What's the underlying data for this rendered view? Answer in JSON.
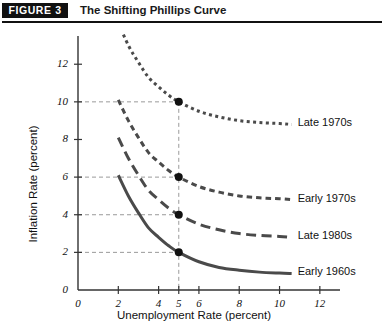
{
  "header": {
    "badge": "FIGURE 3",
    "title": "The Shifting Phillips Curve"
  },
  "chart_data": {
    "type": "line",
    "title": "The Shifting Phillips Curve",
    "xlabel": "Unemployment Rate (percent)",
    "ylabel": "Inflation Rate (percent)",
    "xlim": [
      0,
      13
    ],
    "ylim": [
      0,
      13.5
    ],
    "xticks": [
      0,
      2,
      4,
      5,
      6,
      8,
      10,
      12
    ],
    "xtick_labels": [
      "0",
      "2",
      "4",
      "5",
      "6",
      "8",
      "10",
      "12"
    ],
    "yticks": [
      0,
      2,
      4,
      6,
      8,
      10,
      12
    ],
    "ytick_labels": [
      "0",
      "2",
      "4",
      "6",
      "8",
      "10",
      "12"
    ],
    "grid": false,
    "legend_position": "right-inline",
    "series": [
      {
        "name": "Late 1970s",
        "label": "Late 1970s",
        "style": "dotted",
        "color": "#4a4a4a",
        "marker_point": {
          "x": 5,
          "y": 10
        },
        "points": [
          {
            "x": 2.0,
            "y": 14.2
          },
          {
            "x": 2.5,
            "y": 13.0
          },
          {
            "x": 3.0,
            "y": 12.1
          },
          {
            "x": 3.5,
            "y": 11.3
          },
          {
            "x": 4.0,
            "y": 10.8
          },
          {
            "x": 4.5,
            "y": 10.35
          },
          {
            "x": 5.0,
            "y": 10.0
          },
          {
            "x": 6.0,
            "y": 9.5
          },
          {
            "x": 7.0,
            "y": 9.2
          },
          {
            "x": 8.0,
            "y": 9.0
          },
          {
            "x": 9.0,
            "y": 8.9
          },
          {
            "x": 10.0,
            "y": 8.85
          },
          {
            "x": 10.6,
            "y": 8.8
          }
        ]
      },
      {
        "name": "Early 1970s",
        "label": "Early 1970s",
        "style": "dashed-short",
        "color": "#4a4a4a",
        "marker_point": {
          "x": 5,
          "y": 6
        },
        "points": [
          {
            "x": 2.0,
            "y": 10.1
          },
          {
            "x": 2.5,
            "y": 9.0
          },
          {
            "x": 3.0,
            "y": 8.1
          },
          {
            "x": 3.5,
            "y": 7.3
          },
          {
            "x": 4.0,
            "y": 6.8
          },
          {
            "x": 4.5,
            "y": 6.35
          },
          {
            "x": 5.0,
            "y": 6.0
          },
          {
            "x": 6.0,
            "y": 5.5
          },
          {
            "x": 7.0,
            "y": 5.2
          },
          {
            "x": 8.0,
            "y": 5.0
          },
          {
            "x": 9.0,
            "y": 4.9
          },
          {
            "x": 10.0,
            "y": 4.85
          },
          {
            "x": 10.6,
            "y": 4.8
          }
        ]
      },
      {
        "name": "Late 1980s",
        "label": "Late 1980s",
        "style": "dashed-long",
        "color": "#4a4a4a",
        "marker_point": {
          "x": 5,
          "y": 4
        },
        "points": [
          {
            "x": 2.0,
            "y": 8.1
          },
          {
            "x": 2.5,
            "y": 7.0
          },
          {
            "x": 3.0,
            "y": 6.1
          },
          {
            "x": 3.5,
            "y": 5.3
          },
          {
            "x": 4.0,
            "y": 4.8
          },
          {
            "x": 4.5,
            "y": 4.35
          },
          {
            "x": 5.0,
            "y": 4.0
          },
          {
            "x": 6.0,
            "y": 3.5
          },
          {
            "x": 7.0,
            "y": 3.2
          },
          {
            "x": 8.0,
            "y": 3.0
          },
          {
            "x": 9.0,
            "y": 2.9
          },
          {
            "x": 10.0,
            "y": 2.85
          },
          {
            "x": 10.6,
            "y": 2.8
          }
        ]
      },
      {
        "name": "Early 1960s",
        "label": "Early 1960s",
        "style": "solid",
        "color": "#4a4a4a",
        "marker_point": {
          "x": 5,
          "y": 2
        },
        "points": [
          {
            "x": 2.0,
            "y": 6.1
          },
          {
            "x": 2.5,
            "y": 5.0
          },
          {
            "x": 3.0,
            "y": 4.1
          },
          {
            "x": 3.5,
            "y": 3.3
          },
          {
            "x": 4.0,
            "y": 2.8
          },
          {
            "x": 4.5,
            "y": 2.35
          },
          {
            "x": 5.0,
            "y": 2.0
          },
          {
            "x": 6.0,
            "y": 1.5
          },
          {
            "x": 7.0,
            "y": 1.2
          },
          {
            "x": 8.0,
            "y": 1.05
          },
          {
            "x": 9.0,
            "y": 0.95
          },
          {
            "x": 10.0,
            "y": 0.9
          },
          {
            "x": 10.6,
            "y": 0.88
          }
        ]
      }
    ],
    "guide_lines": {
      "vertical_at_x": 5,
      "horizontal_at_y": [
        10,
        6,
        4,
        2
      ],
      "color": "#9a9a9a"
    },
    "colors": {
      "axis": "#333333",
      "curve": "#4a4a4a",
      "marker": "#111111",
      "guide": "#9a9a9a",
      "badge_bg": "#111111",
      "badge_text": "#ffffff"
    }
  }
}
